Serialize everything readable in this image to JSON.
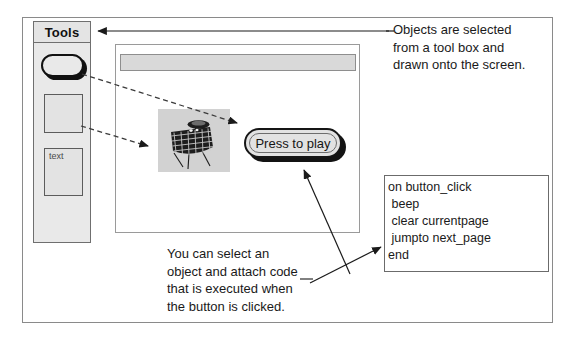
{
  "tools_palette": {
    "title": "Tools",
    "items": [
      {
        "name": "button-tool",
        "label": ""
      },
      {
        "name": "rectangle-tool",
        "label": ""
      },
      {
        "name": "text-tool",
        "label": "text"
      }
    ]
  },
  "app_window": {
    "titlebar": "",
    "button": {
      "label": "Press to play"
    },
    "clipart": {
      "name": "satellite-clipart"
    }
  },
  "code_box": {
    "lines": [
      "on button_click",
      " beep",
      " clear currentpage",
      " jumpto next_page",
      "end"
    ]
  },
  "captions": {
    "objects_selected": {
      "line1": "Objects are selected",
      "line2": "from a tool box and",
      "line3": "drawn onto the screen."
    },
    "attach_code": {
      "line1": "You can select an",
      "line2": "object and attach code",
      "line3": "that is executed when",
      "line4": "the button is clicked."
    }
  },
  "colors": {
    "frame_border": "#8a8a8a",
    "palette_fill": "#e9e9e9",
    "titlebar_fill": "#d9d9d9",
    "button_outline": "#151515",
    "text": "#1a1a1a",
    "clipart_bg": "#d2d2d2"
  }
}
